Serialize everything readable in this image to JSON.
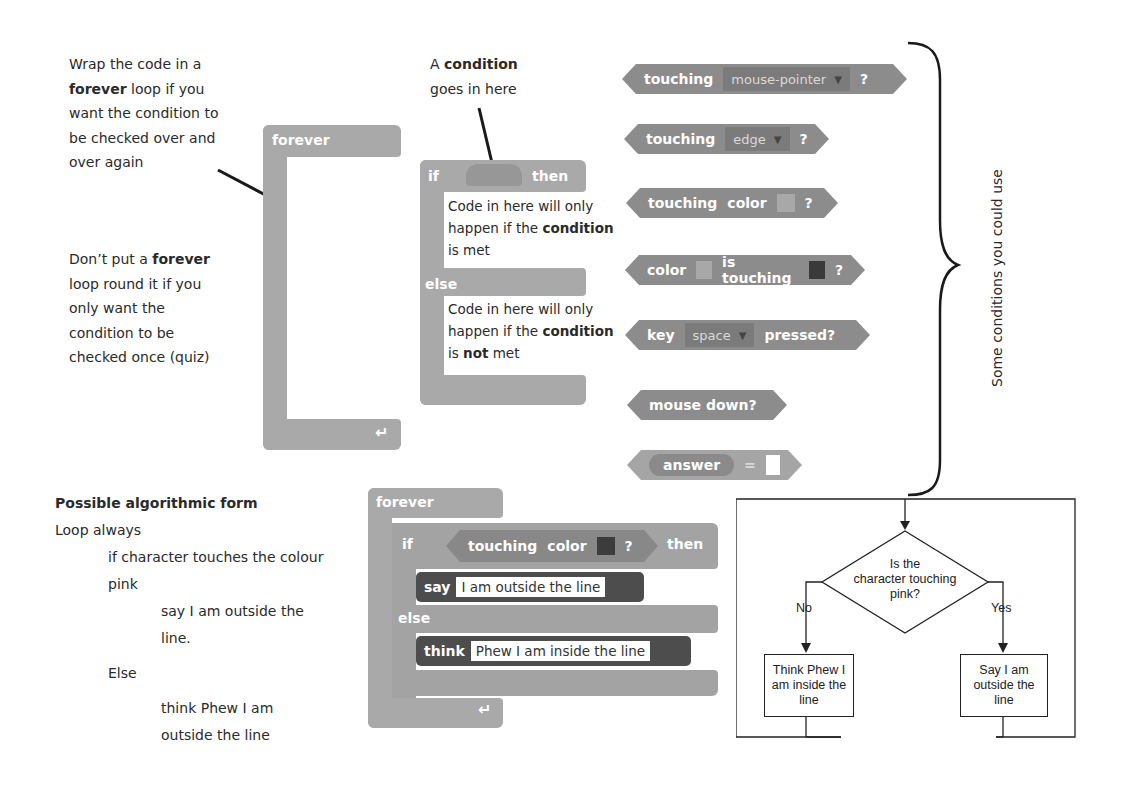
{
  "notes": {
    "forever_tip": {
      "line1": "Wrap the code in a",
      "line2_bold": "forever",
      "line2_rest": " loop if you",
      "line3": "want the condition to",
      "line4": "be checked over and",
      "line5": "over again"
    },
    "no_forever_tip": {
      "line1_pre": "Don’t put a ",
      "line1_bold": "forever",
      "line2": "loop round it if you",
      "line3": "only want the",
      "line4": "condition to be",
      "line5": "checked once (quiz)"
    },
    "condition_tip": {
      "line1_pre": "A ",
      "line1_bold": "condition",
      "line2": "goes in here"
    },
    "if_body": {
      "line1": "Code in here will only",
      "line2_pre": "happen if the ",
      "line2_bold": "condition",
      "line3": "is met"
    },
    "else_body": {
      "line1": "Code in here will only",
      "line2_pre": "happen if the ",
      "line2_bold": "condition",
      "line3_pre": "is ",
      "line3_bold": "not",
      "line3_rest": " met"
    },
    "brace_label": "Some conditions you could use"
  },
  "blocks": {
    "forever_label": "forever",
    "if_label": "if",
    "then_label": "then",
    "else_label": "else",
    "loop_arrow": "↵"
  },
  "conditions": [
    {
      "parts": [
        "touching"
      ],
      "dropdown": "mouse-pointer",
      "suffix": "?"
    },
    {
      "parts": [
        "touching"
      ],
      "dropdown": "edge",
      "suffix": "?"
    },
    {
      "parts": [
        "touching",
        "color"
      ],
      "swatch": "#a8a8a8",
      "suffix": "?"
    },
    {
      "label1": "color",
      "swatch1": "#a8a8a8",
      "label2": "is touching",
      "swatch2": "#3a3a3a",
      "suffix": "?"
    },
    {
      "label1": "key",
      "dropdown": "space",
      "label2": "pressed?"
    },
    {
      "label1": "mouse down?"
    },
    {
      "reporter": "answer",
      "op": "="
    }
  ],
  "algorithm": {
    "title": "Possible algorithmic form",
    "lines": [
      {
        "indent": 0,
        "text": "Loop always"
      },
      {
        "indent": 1,
        "text": "if character touches the colour"
      },
      {
        "indent": 1,
        "text": "pink"
      },
      {
        "indent": 2,
        "text": "say I am outside the"
      },
      {
        "indent": 2,
        "text": "line."
      },
      {
        "indent": 1,
        "text": "Else"
      },
      {
        "indent": 2,
        "text": "think Phew I am"
      },
      {
        "indent": 2,
        "text": "outside the line"
      }
    ]
  },
  "example_script": {
    "forever_label": "forever",
    "if_label": "if",
    "condition_touching": "touching",
    "condition_color": "color",
    "condition_swatch": "#3c3c3c",
    "condition_q": "?",
    "then_label": "then",
    "say_label": "say",
    "say_text": "I am outside the line",
    "else_label": "else",
    "think_label": "think",
    "think_text": "Phew I am inside the line"
  },
  "flowchart": {
    "decision": "Is the character touching pink?",
    "decision_lines": [
      "Is the",
      "character touching",
      "pink?"
    ],
    "no_label": "No",
    "yes_label": "Yes",
    "no_box": [
      "Think Phew I",
      "am inside the",
      "line"
    ],
    "yes_box": [
      "Say I am",
      "outside the",
      "line"
    ]
  },
  "colors": {
    "control_block": "#a9a9a9",
    "sensing_block": "#8c8c8c",
    "looks_block": "#4d4d4d",
    "text": "#2a2a2a"
  }
}
